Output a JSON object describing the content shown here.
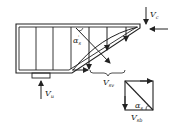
{
  "diagram": {
    "type": "structural-force-diagram",
    "colors": {
      "stroke": "#222222",
      "background": "#ffffff"
    },
    "labels": {
      "vc": {
        "main": "V",
        "sub": "c"
      },
      "vu": {
        "main": "V",
        "sub": "u"
      },
      "vsv": {
        "main": "V",
        "sub": "sv"
      },
      "vsb": {
        "main": "V",
        "sub": "sb"
      },
      "alpha_s_prime": {
        "main": "α",
        "sub": "s",
        "sup": "'"
      },
      "alpha_s": {
        "main": "α",
        "sub": "s"
      }
    }
  }
}
